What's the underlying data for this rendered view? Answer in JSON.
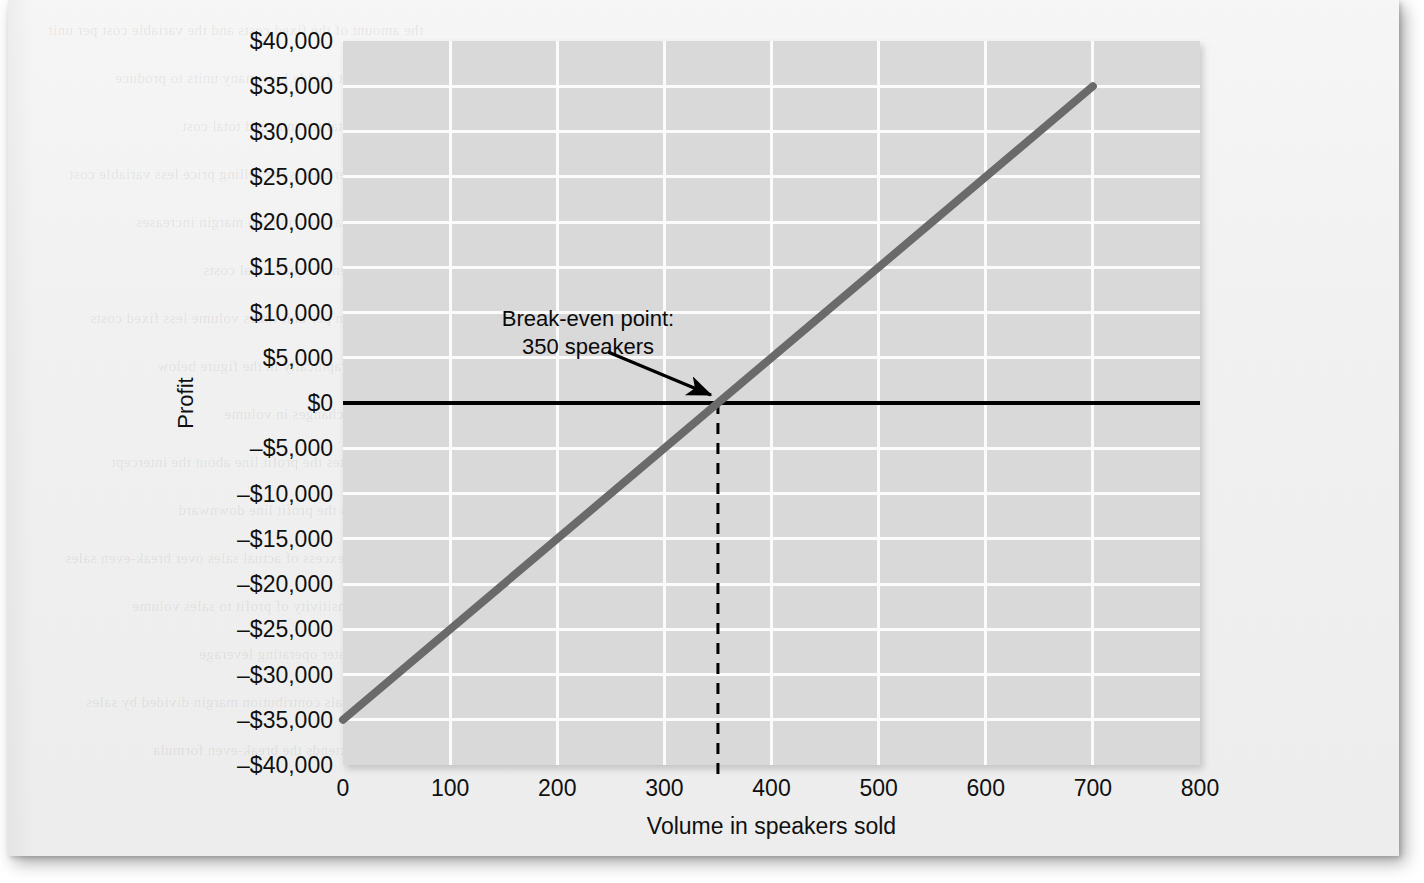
{
  "figure": {
    "background_color": "#d9d9d9",
    "gridline_color": "#fbfbfb",
    "series_color": "#6a6a6a",
    "zero_line_color": "#000000",
    "annotation_color": "#0a0a0a"
  },
  "chart_data": {
    "type": "line",
    "title": "",
    "xlabel": "Volume in speakers sold",
    "ylabel": "Profit",
    "xlim": [
      0,
      800
    ],
    "ylim": [
      -40000,
      40000
    ],
    "xticks": [
      0,
      100,
      200,
      300,
      400,
      500,
      600,
      700,
      800
    ],
    "xtick_labels": [
      "0",
      "100",
      "200",
      "300",
      "400",
      "500",
      "600",
      "700",
      "800"
    ],
    "yticks": [
      40000,
      35000,
      30000,
      25000,
      20000,
      15000,
      10000,
      5000,
      0,
      -5000,
      -10000,
      -15000,
      -20000,
      -25000,
      -30000,
      -35000,
      -40000
    ],
    "ytick_labels": [
      "$40,000",
      "$35,000",
      "$30,000",
      "$25,000",
      "$20,000",
      "$15,000",
      "$10,000",
      "$5,000",
      "$0",
      "–$5,000",
      "–$10,000",
      "–$15,000",
      "–$20,000",
      "–$25,000",
      "–$30,000",
      "–$35,000",
      "–$40,000"
    ],
    "grid": true,
    "legend": false,
    "series": [
      {
        "name": "Profit",
        "x": [
          0,
          700
        ],
        "values": [
          -35000,
          35000
        ],
        "slope_per_unit": 100,
        "intercept": -35000,
        "x_intercept": 350
      }
    ],
    "reference_lines": [
      {
        "name": "zero-profit-line",
        "orientation": "horizontal",
        "value": 0,
        "style": "solid"
      },
      {
        "name": "break-even-volume-line",
        "orientation": "vertical",
        "value": 350,
        "style": "dashed",
        "from": -40000,
        "to": 0
      }
    ],
    "annotations": [
      {
        "name": "break-even-annotation",
        "line1": "Break-even point:",
        "line2": "350 speakers",
        "points_to_x": 350,
        "points_to_y": 0
      }
    ]
  },
  "showthrough_lines": [
    "the amount of the fixed costs and the variable cost per unit",
    "company management must decide how many units to produce",
    "the CVP analysis depends on the total revenue and total cost",
    "contribution margin per unit is the selling price less variable cost",
    "as volume increases the total contribution margin increases",
    "the break-even point occurs where total revenue equals total costs",
    "profit equals contribution margin per unit times volume less fixed costs",
    "this relationship is shown graphically in the figure below",
    "managers use this chart to evaluate the effect of changes in volume",
    "a change in the selling price rotates the profit line about the intercept",
    "an increase in fixed costs shifts the profit line downward",
    "the margin of safety is the excess of actual sales over break-even sales",
    "operating leverage measures the sensitivity of profit to sales volume",
    "companies with high fixed costs have greater operating leverage",
    "the contribution margin ratio equals contribution margin divided by sales",
    "target profit analysis extends the break-even formula"
  ]
}
